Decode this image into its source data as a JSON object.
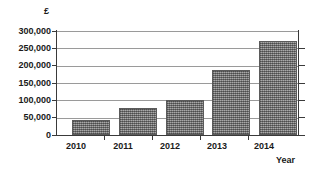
{
  "chart_data": {
    "type": "bar",
    "title": "",
    "subtitle": "",
    "xlabel": "Year",
    "ylabel": "£",
    "categories": [
      "2010",
      "2011",
      "2012",
      "2013",
      "2014"
    ],
    "values": [
      43000,
      77000,
      100000,
      187000,
      270000
    ],
    "series": [
      {
        "name": "Amount",
        "values": [
          43000,
          77000,
          100000,
          187000,
          270000
        ]
      }
    ],
    "ylim": [
      0,
      300000
    ],
    "ytick_labels": [
      "300,000",
      "250,000",
      "200,000",
      "150,000",
      "100,000",
      "50,000",
      "0"
    ],
    "ytick_values": [
      300000,
      250000,
      200000,
      150000,
      100000,
      50000,
      0
    ],
    "ytick_step": 50000,
    "grid": true,
    "grid_axis": "y",
    "legend": false,
    "legend_position": "none",
    "bar_color": "#8c8c8c",
    "bar_edge_color": "#5b5b5b",
    "gridline_color": "#9a9a9a",
    "axis_color": "#3a3a3a",
    "background_color": "#ffffff",
    "annotations": []
  },
  "axes": {
    "y_unit_label": "£",
    "x_title": "Year"
  }
}
